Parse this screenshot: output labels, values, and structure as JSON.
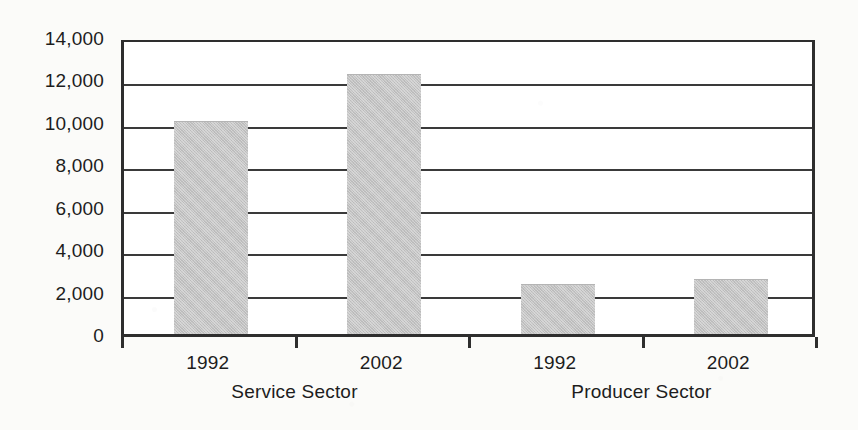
{
  "chart_data": {
    "type": "bar",
    "title": "",
    "subtitle": "",
    "xlabel": "",
    "ylabel": "",
    "ylim": [
      0,
      14000
    ],
    "ytick_values": [
      0,
      2000,
      4000,
      6000,
      8000,
      10000,
      12000,
      14000
    ],
    "ytick_labels": [
      "0",
      "2,000",
      "4,000",
      "6,000",
      "8,000",
      "10,000",
      "12,000",
      "14,000"
    ],
    "grid": true,
    "grid_axis": "y",
    "legend": false,
    "legend_position": "none",
    "categories": [
      "1992",
      "2002",
      "1992",
      "2002"
    ],
    "values": [
      10000,
      12200,
      2300,
      2550
    ],
    "groups": [
      {
        "label": "Service Sector",
        "categories": [
          "1992",
          "2002"
        ],
        "values": [
          10000,
          12200
        ]
      },
      {
        "label": "Producer Sector",
        "categories": [
          "1992",
          "2002"
        ],
        "values": [
          2300,
          2550
        ]
      }
    ],
    "bar_color": "#c3c3c3",
    "axis_color": "#2e2e2e",
    "background_color": "#fbfbf9"
  },
  "axis": {
    "y_ticks": [
      {
        "label": "14,000",
        "value": 14000
      },
      {
        "label": "12,000",
        "value": 12000
      },
      {
        "label": "10,000",
        "value": 10000
      },
      {
        "label": "8,000",
        "value": 8000
      },
      {
        "label": "6,000",
        "value": 6000
      },
      {
        "label": "4,000",
        "value": 4000
      },
      {
        "label": "2,000",
        "value": 2000
      },
      {
        "label": "0",
        "value": 0
      }
    ]
  },
  "bars": [
    {
      "category": "1992",
      "group": "Service Sector",
      "value": 10000
    },
    {
      "category": "2002",
      "group": "Service Sector",
      "value": 12200
    },
    {
      "category": "1992",
      "group": "Producer Sector",
      "value": 2300
    },
    {
      "category": "2002",
      "group": "Producer Sector",
      "value": 2550
    }
  ],
  "groups": [
    {
      "label": "Service Sector"
    },
    {
      "label": "Producer Sector"
    }
  ]
}
